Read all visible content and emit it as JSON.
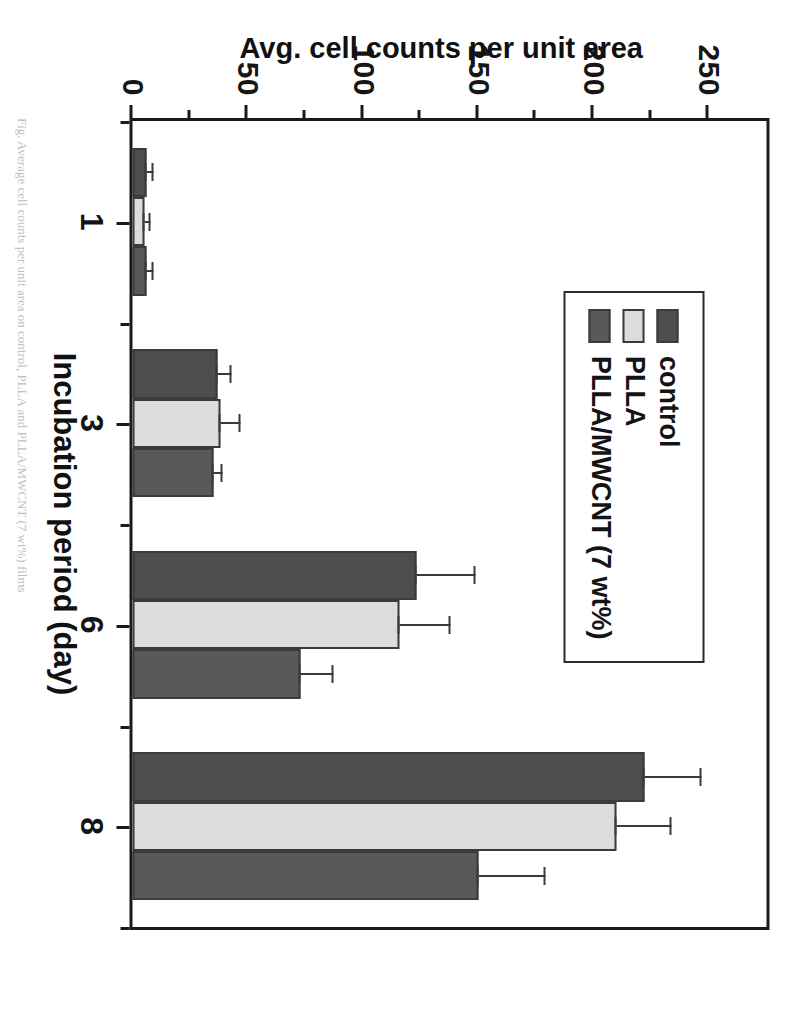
{
  "figure": {
    "background": "#ffffff",
    "frame_color": "#1a1a1a"
  },
  "legend": {
    "position": "top-left-inside",
    "items": [
      {
        "label": "control",
        "color": "#4d4d4d"
      },
      {
        "label": "PLLA",
        "color": "#dcdcdc"
      },
      {
        "label": "PLLA/MWCNT (7 wt%)",
        "color": "#595959"
      }
    ]
  },
  "axes": {
    "y_title": "Avg. cell counts per unit area",
    "y_ticks": [
      "0",
      "50",
      "100",
      "150",
      "200",
      "250"
    ],
    "x_title": "Incubation period (day)",
    "x_ticks": [
      "1",
      "3",
      "6",
      "8"
    ]
  },
  "caption": {
    "text": "Fig. Average cell counts per unit area on control, PLLA and PLLA/MWCNT (7 wt%) films"
  },
  "chart_data": {
    "type": "bar",
    "title": "",
    "subtitle": "",
    "xlabel": "Incubation period (day)",
    "ylabel": "Avg. cell counts per unit area",
    "categories": [
      "1",
      "3",
      "6",
      "8"
    ],
    "ylim": [
      0,
      275
    ],
    "yticks": [
      0,
      50,
      100,
      150,
      200,
      250
    ],
    "grid": false,
    "legend_position": "upper left",
    "orientation": "vertical",
    "bar_group_gap": 0,
    "series": [
      {
        "name": "control",
        "color": "#4d4d4d",
        "values": [
          6,
          37,
          123,
          222
        ],
        "errors": [
          3,
          6,
          26,
          25
        ]
      },
      {
        "name": "PLLA",
        "color": "#dcdcdc",
        "values": [
          5,
          38,
          116,
          210
        ],
        "errors": [
          3,
          9,
          22,
          24
        ]
      },
      {
        "name": "PLLA/MWCNT (7 wt%)",
        "color": "#595959",
        "values": [
          6,
          35,
          73,
          150
        ],
        "errors": [
          3,
          4,
          14,
          29
        ]
      }
    ]
  }
}
